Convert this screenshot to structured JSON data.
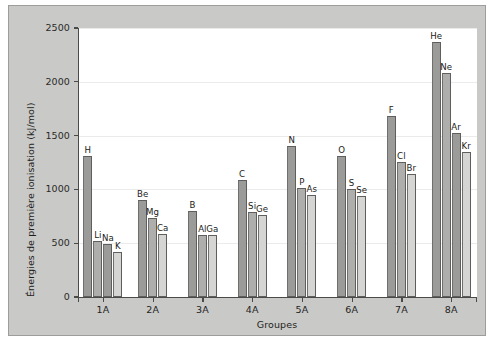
{
  "chart_data": {
    "type": "bar",
    "title": "",
    "xlabel": "Groupes",
    "ylabel": "Énergies de première ionisation (kJ/mol)",
    "ylim": [
      0,
      2500
    ],
    "yticks": [
      0,
      500,
      1000,
      1500,
      2000,
      2500
    ],
    "ytick_labels": [
      "0",
      "500",
      "1000",
      "1500",
      "2000",
      "2500"
    ],
    "grid": true,
    "legend": "none",
    "categories": [
      "1A",
      "2A",
      "3A",
      "4A",
      "5A",
      "6A",
      "7A",
      "8A"
    ],
    "groups": [
      {
        "category": "1A",
        "bars": [
          {
            "label": "H",
            "value": 1312,
            "shade": "dark"
          },
          {
            "label": "Li",
            "value": 520,
            "shade": "mid"
          },
          {
            "label": "Na",
            "value": 496,
            "shade": "dark"
          },
          {
            "label": "K",
            "value": 419,
            "shade": "light"
          }
        ]
      },
      {
        "category": "2A",
        "bars": [
          {
            "label": "Be",
            "value": 900,
            "shade": "dark"
          },
          {
            "label": "Mg",
            "value": 738,
            "shade": "mid"
          },
          {
            "label": "Ca",
            "value": 590,
            "shade": "light"
          }
        ]
      },
      {
        "category": "3A",
        "bars": [
          {
            "label": "B",
            "value": 801,
            "shade": "dark"
          },
          {
            "label": "Al",
            "value": 578,
            "shade": "mid"
          },
          {
            "label": "Ga",
            "value": 579,
            "shade": "light"
          }
        ]
      },
      {
        "category": "4A",
        "bars": [
          {
            "label": "C",
            "value": 1086,
            "shade": "dark"
          },
          {
            "label": "Si",
            "value": 786,
            "shade": "mid"
          },
          {
            "label": "Ge",
            "value": 762,
            "shade": "light"
          }
        ]
      },
      {
        "category": "5A",
        "bars": [
          {
            "label": "N",
            "value": 1402,
            "shade": "dark"
          },
          {
            "label": "P",
            "value": 1012,
            "shade": "mid"
          },
          {
            "label": "As",
            "value": 947,
            "shade": "light"
          }
        ]
      },
      {
        "category": "6A",
        "bars": [
          {
            "label": "O",
            "value": 1314,
            "shade": "dark"
          },
          {
            "label": "S",
            "value": 1000,
            "shade": "mid"
          },
          {
            "label": "Se",
            "value": 941,
            "shade": "light"
          }
        ]
      },
      {
        "category": "7A",
        "bars": [
          {
            "label": "F",
            "value": 1681,
            "shade": "dark"
          },
          {
            "label": "Cl",
            "value": 1251,
            "shade": "mid"
          },
          {
            "label": "Br",
            "value": 1140,
            "shade": "light"
          }
        ]
      },
      {
        "category": "8A",
        "bars": [
          {
            "label": "He",
            "value": 2372,
            "shade": "dark"
          },
          {
            "label": "Ne",
            "value": 2081,
            "shade": "mid"
          },
          {
            "label": "Ar",
            "value": 1521,
            "shade": "dark"
          },
          {
            "label": "Kr",
            "value": 1351,
            "shade": "light"
          }
        ]
      }
    ]
  },
  "style": {
    "panel_bg": "#c9c9c7",
    "plot_bg": "#ffffff",
    "axis_color": "#4a4a48",
    "grid_color": "#ebebea",
    "bar_dark": "#9b9b99",
    "bar_mid": "#aeaeac",
    "bar_light": "#d5d5d3"
  }
}
